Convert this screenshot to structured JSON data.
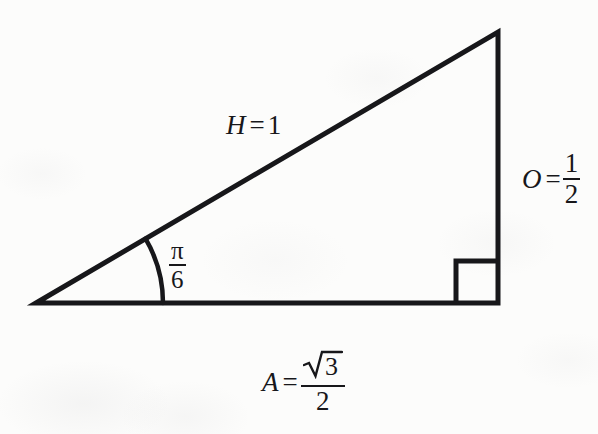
{
  "figure": {
    "background_color": "#fcfcfb",
    "stroke_color": "#17171a",
    "stroke_width": 5
  },
  "labels": {
    "hypotenuse": {
      "variable": "H",
      "equals": "=",
      "value": "1",
      "full_text": "H = 1"
    },
    "opposite": {
      "variable": "O",
      "equals": "=",
      "numerator": "1",
      "denominator": "2",
      "full_text": "O = 1/2"
    },
    "adjacent": {
      "variable": "A",
      "equals": "=",
      "numerator": "3",
      "radical": "√",
      "denominator": "2",
      "full_text": "A = √3/2"
    },
    "angle": {
      "numerator": "π",
      "denominator": "6",
      "full_text": "π/6"
    }
  },
  "geometry": {
    "vertex_left": [
      36,
      303
    ],
    "vertex_top_right": [
      498,
      32
    ],
    "vertex_bottom_right": [
      498,
      303
    ],
    "right_angle_marker_size": 42,
    "angle_arc_radius": 127
  },
  "chart_data": {
    "type": "diagram",
    "shape": "right triangle",
    "sides": [
      {
        "name": "hypotenuse",
        "symbol": "H",
        "value": "1",
        "position": "upper-left slanted edge"
      },
      {
        "name": "opposite",
        "symbol": "O",
        "value": "1/2",
        "position": "right vertical edge"
      },
      {
        "name": "adjacent",
        "symbol": "A",
        "value": "√3/2",
        "position": "bottom horizontal edge"
      }
    ],
    "angles": [
      {
        "name": "theta",
        "value": "π/6",
        "location": "left vertex",
        "marked_with": "arc"
      },
      {
        "name": "right angle",
        "value": "π/2",
        "location": "bottom-right vertex",
        "marked_with": "square"
      }
    ]
  }
}
